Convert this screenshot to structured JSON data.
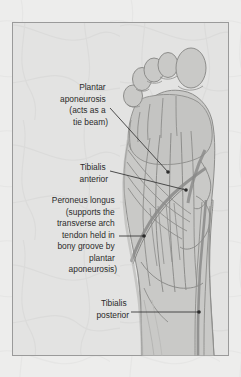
{
  "figure": {
    "view": "plantar (sole) view, right foot, toes at top",
    "panel": {
      "background_color": "#e3e3e2",
      "border_color": "#9a9a9a",
      "page_background_color": "#ededec"
    },
    "illustration": {
      "name": "foot-and-lower-leg-plantar-view",
      "fill_color": "#c9c9c7",
      "outline_color": "#8d8d8b",
      "tendon_color": "#8d8d8b",
      "shadow_color": "#b8b8b6"
    },
    "leader_line_color": "#3a3a3a"
  },
  "labels": [
    {
      "id": "plantar-aponeurosis",
      "lines": [
        "Plantar",
        "aponeurosis",
        "(acts as a",
        "tie beam)"
      ],
      "text_anchor_x": 108,
      "text_start_y": 90,
      "line_height": 11.5,
      "leader": {
        "x1": 110,
        "y1": 108,
        "x2": 168,
        "y2": 172
      },
      "dot": {
        "cx": 168,
        "cy": 172,
        "r": 1.8
      }
    },
    {
      "id": "tibialis-anterior",
      "lines": [
        "Tibialis",
        "anterior"
      ],
      "text_anchor_x": 108,
      "text_start_y": 170,
      "line_height": 11.5,
      "leader": {
        "x1": 110,
        "y1": 171,
        "x2": 186,
        "y2": 190
      },
      "dot": {
        "cx": 186,
        "cy": 190,
        "r": 1.8
      }
    },
    {
      "id": "peroneus-longus",
      "lines": [
        "Peroneus longus",
        "(supports the",
        "transverse arch",
        "tendon held in",
        "bony groove by",
        "plantar",
        "aponeurosis)"
      ],
      "text_anchor_x": 117,
      "text_start_y": 203,
      "line_height": 11.5,
      "leader": {
        "x1": 119,
        "y1": 236,
        "x2": 144,
        "y2": 236
      },
      "dot": {
        "cx": 144,
        "cy": 236,
        "r": 1.8
      }
    },
    {
      "id": "tibialis-posterior",
      "lines": [
        "Tibialis",
        "posterior"
      ],
      "text_anchor_x": 129,
      "text_start_y": 306,
      "line_height": 11.5,
      "leader": {
        "x1": 131,
        "y1": 312,
        "x2": 199,
        "y2": 312
      },
      "dot": {
        "cx": 199,
        "cy": 312,
        "r": 1.8
      }
    }
  ]
}
